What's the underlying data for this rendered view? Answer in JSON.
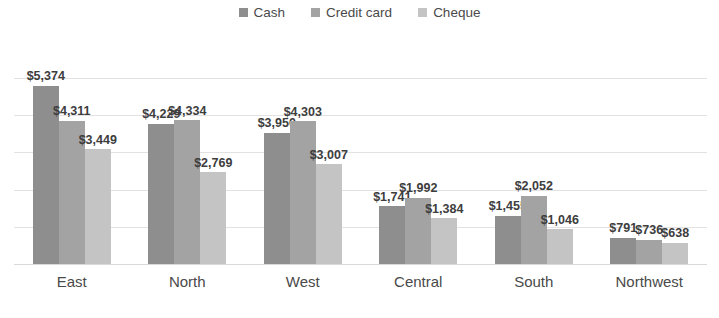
{
  "chart_data": {
    "type": "bar",
    "title": "",
    "subtitle": "",
    "xlabel": "",
    "ylabel": "",
    "ylim": [
      0,
      5600
    ],
    "grid": true,
    "legend_position": "top-center",
    "grouping": "clustered",
    "value_prefix": "$",
    "categories": [
      "East",
      "North",
      "West",
      "Central",
      "South",
      "Northwest"
    ],
    "series": [
      {
        "name": "Cash",
        "color": "#8e8e8e",
        "values": [
          5374,
          4229,
          3950,
          1741,
          1455,
          791
        ],
        "labels": [
          "$5,374",
          "$4,229",
          "$3,950",
          "$1,741",
          "$1,455",
          "$791"
        ]
      },
      {
        "name": "Credit card",
        "color": "#a3a3a3",
        "values": [
          4311,
          4334,
          4303,
          1992,
          2052,
          736
        ],
        "labels": [
          "$4,311",
          "$4,334",
          "$4,303",
          "$1,992",
          "$2,052",
          "$736"
        ]
      },
      {
        "name": "Cheque",
        "color": "#c4c4c4",
        "values": [
          3449,
          2769,
          3007,
          1384,
          1046,
          638
        ],
        "labels": [
          "$3,449",
          "$2,769",
          "$3,007",
          "$1,384",
          "$1,046",
          "$638"
        ]
      }
    ],
    "gridline_values": [
      1120,
      2240,
      3360,
      4480,
      5600
    ]
  },
  "legend": {
    "items": [
      {
        "label": "Cash",
        "color": "#8e8e8e",
        "marker": "square-marker"
      },
      {
        "label": "Credit card",
        "color": "#a3a3a3",
        "marker": "square-marker"
      },
      {
        "label": "Cheque",
        "color": "#c4c4c4",
        "marker": "square-marker"
      }
    ]
  },
  "axis": {
    "baseline_color": "#d9d9d9",
    "gridline_color": "#e2e2e2"
  }
}
